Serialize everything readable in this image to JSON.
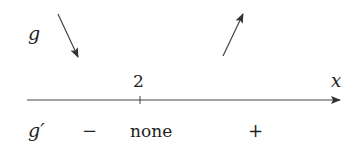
{
  "diagram": {
    "function_label": "g",
    "derivative_label": "g′",
    "axis_label": "x",
    "critical_point": "2",
    "variation": [
      {
        "interval": "left of 2",
        "direction": "decreasing",
        "arrow": "down-arrow"
      },
      {
        "interval": "right of 2",
        "direction": "increasing",
        "arrow": "up-arrow"
      }
    ],
    "sign_row": {
      "left_sign": "−",
      "at_point": "none",
      "right_sign": "+"
    },
    "colors": {
      "ink": "#222222",
      "background": "#ffffff"
    }
  }
}
